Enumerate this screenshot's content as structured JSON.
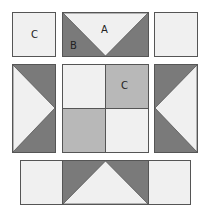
{
  "diagram": {
    "type": "quilt-block-layout",
    "colors": {
      "light": "#f0f0f0",
      "medium": "#b8b8b8",
      "dark": "#7a7a7a",
      "border": "#555555"
    },
    "pieces": {
      "top_left_square": {
        "label": "C"
      },
      "top_flying_geese": {
        "center_label": "A",
        "side_label": "B"
      },
      "top_right_square": {
        "label": ""
      },
      "left_flying_geese": {
        "label": ""
      },
      "center_four_patch": {
        "label": "C"
      },
      "right_flying_geese": {
        "label": ""
      },
      "bottom_strip": {
        "label": ""
      }
    }
  }
}
